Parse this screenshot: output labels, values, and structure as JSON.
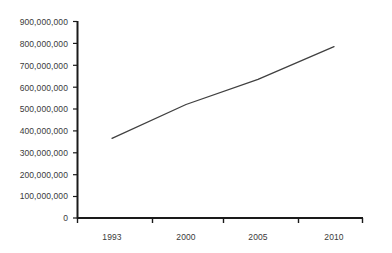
{
  "chart_data": {
    "type": "line",
    "title": "",
    "xlabel": "",
    "ylabel": "",
    "x": [
      1993,
      2000,
      2005,
      2010
    ],
    "categories": [
      "1993",
      "2000",
      "2005",
      "2010"
    ],
    "values": [
      365000000,
      520000000,
      635000000,
      785000000
    ],
    "series": [
      {
        "name": "",
        "values": [
          365000000,
          520000000,
          635000000,
          785000000
        ]
      }
    ],
    "ylim": [
      0,
      900000000
    ],
    "ytick_labels": [
      "900,000,000",
      "800,000,000",
      "700,000,000",
      "600,000,000",
      "500,000,000",
      "400,000,000",
      "300,000,000",
      "200,000,000",
      "100,000,000",
      "0"
    ],
    "ytick_values": [
      900000000,
      800000000,
      700000000,
      600000000,
      500000000,
      400000000,
      300000000,
      200000000,
      100000000,
      0
    ],
    "xtick_labels": [
      "1993",
      "2000",
      "2005",
      "2010"
    ],
    "grid": false,
    "legend": false,
    "legend_position": "none",
    "line_color": "#404040",
    "axis_color": "#1a1a1a",
    "text_color": "#3a3a3a",
    "background_color": "#ffffff"
  }
}
